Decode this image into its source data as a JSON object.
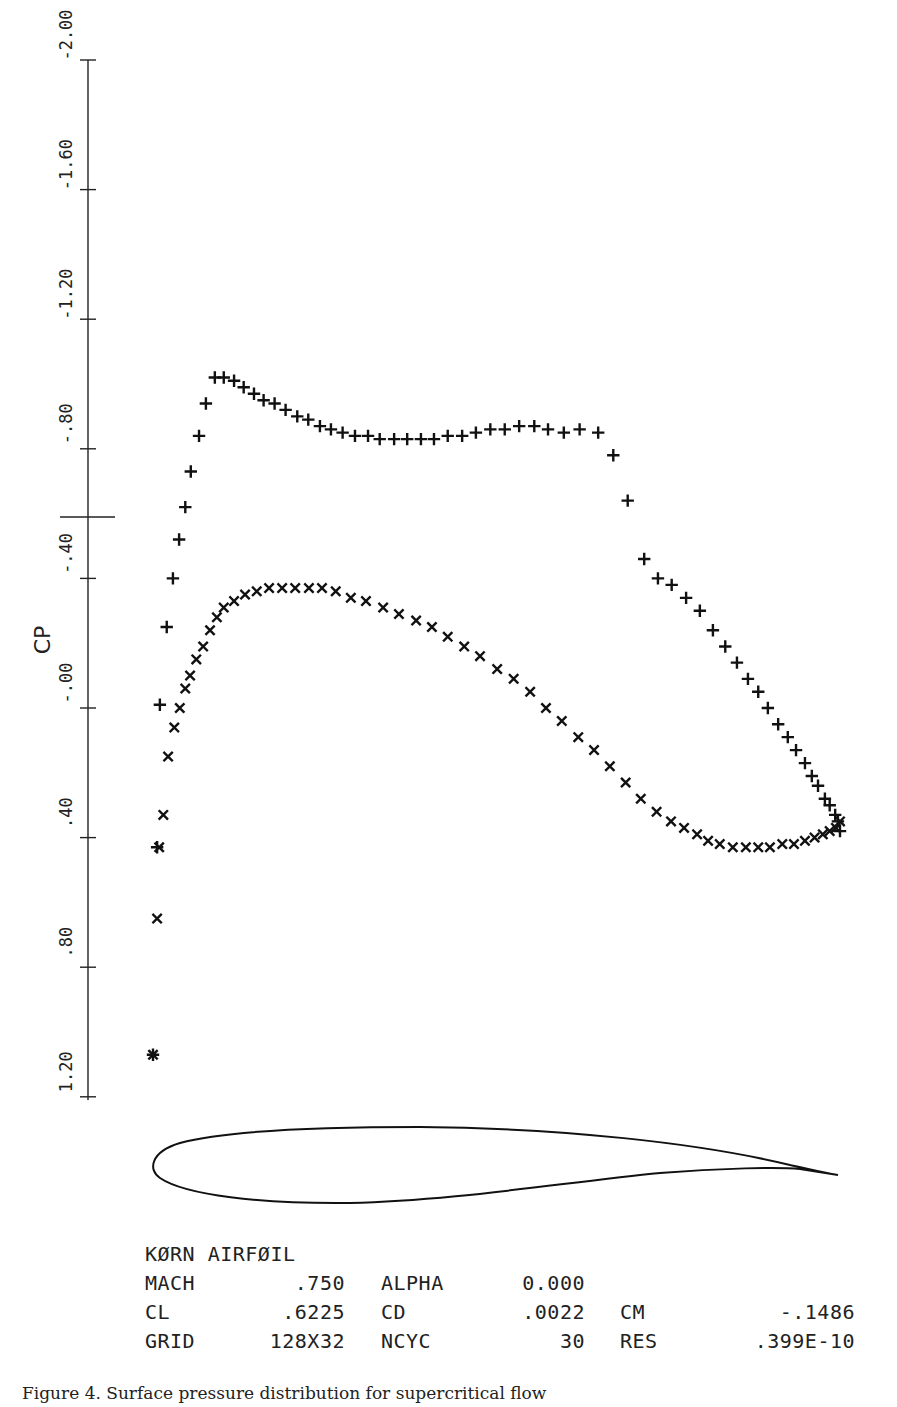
{
  "chart_data": {
    "type": "scatter",
    "xlabel": "",
    "ylabel": "CP",
    "ylim": [
      1.2,
      -2.0
    ],
    "y_inverted": true,
    "yticks": [
      -2.0,
      -1.6,
      -1.2,
      -0.8,
      -0.4,
      0.0,
      0.4,
      0.8,
      1.2
    ],
    "ytick_labels": [
      "-2.00",
      "-1.60",
      "-1.20",
      "-.80",
      "-.40",
      "-.00",
      ".40",
      ".80",
      "1.20"
    ],
    "critical_cp_marker": -0.59,
    "grid": false,
    "legend": null,
    "x_description": "chordwise position x/c (0 = leading edge, 1 = trailing edge); drawn aligned with airfoil below",
    "series": [
      {
        "name": "upper surface",
        "marker": "+",
        "x": [
          0.0,
          0.006,
          0.01,
          0.02,
          0.029,
          0.038,
          0.047,
          0.055,
          0.067,
          0.077,
          0.09,
          0.103,
          0.118,
          0.132,
          0.147,
          0.161,
          0.177,
          0.193,
          0.21,
          0.226,
          0.243,
          0.259,
          0.276,
          0.294,
          0.313,
          0.33,
          0.351,
          0.37,
          0.39,
          0.409,
          0.429,
          0.45,
          0.47,
          0.491,
          0.512,
          0.533,
          0.555,
          0.575,
          0.598,
          0.621,
          0.648,
          0.67,
          0.691,
          0.715,
          0.735,
          0.755,
          0.776,
          0.796,
          0.815,
          0.833,
          0.85,
          0.866,
          0.881,
          0.895,
          0.91,
          0.924,
          0.936,
          0.949,
          0.959,
          0.968,
          0.978,
          0.985,
          0.993,
          0.997,
          1.0
        ],
        "values": [
          1.07,
          0.43,
          -0.01,
          -0.25,
          -0.4,
          -0.52,
          -0.62,
          -0.73,
          -0.84,
          -0.94,
          -1.02,
          -1.02,
          -1.01,
          -0.99,
          -0.97,
          -0.95,
          -0.94,
          -0.92,
          -0.9,
          -0.89,
          -0.87,
          -0.86,
          -0.85,
          -0.84,
          -0.84,
          -0.83,
          -0.83,
          -0.83,
          -0.83,
          -0.83,
          -0.84,
          -0.84,
          -0.85,
          -0.86,
          -0.86,
          -0.87,
          -0.87,
          -0.86,
          -0.85,
          -0.86,
          -0.85,
          -0.78,
          -0.64,
          -0.46,
          -0.4,
          -0.38,
          -0.34,
          -0.3,
          -0.24,
          -0.19,
          -0.14,
          -0.09,
          -0.05,
          0.0,
          0.05,
          0.09,
          0.13,
          0.17,
          0.21,
          0.24,
          0.28,
          0.3,
          0.33,
          0.35,
          0.38
        ]
      },
      {
        "name": "lower surface",
        "marker": "x",
        "x": [
          0.0,
          0.006,
          0.009,
          0.015,
          0.022,
          0.031,
          0.039,
          0.047,
          0.054,
          0.063,
          0.073,
          0.083,
          0.093,
          0.103,
          0.118,
          0.134,
          0.151,
          0.169,
          0.188,
          0.207,
          0.227,
          0.246,
          0.266,
          0.288,
          0.31,
          0.335,
          0.358,
          0.383,
          0.406,
          0.429,
          0.453,
          0.476,
          0.501,
          0.525,
          0.549,
          0.572,
          0.595,
          0.619,
          0.642,
          0.665,
          0.688,
          0.71,
          0.733,
          0.754,
          0.773,
          0.792,
          0.808,
          0.825,
          0.844,
          0.863,
          0.881,
          0.898,
          0.916,
          0.933,
          0.949,
          0.963,
          0.975,
          0.985,
          0.994,
          1.0
        ],
        "values": [
          1.07,
          0.65,
          0.43,
          0.33,
          0.15,
          0.06,
          0.0,
          -0.06,
          -0.1,
          -0.15,
          -0.19,
          -0.24,
          -0.28,
          -0.31,
          -0.33,
          -0.35,
          -0.36,
          -0.37,
          -0.37,
          -0.37,
          -0.37,
          -0.37,
          -0.36,
          -0.34,
          -0.33,
          -0.31,
          -0.29,
          -0.27,
          -0.25,
          -0.22,
          -0.19,
          -0.16,
          -0.12,
          -0.09,
          -0.05,
          0.0,
          0.04,
          0.09,
          0.13,
          0.18,
          0.23,
          0.28,
          0.32,
          0.35,
          0.37,
          0.39,
          0.41,
          0.42,
          0.43,
          0.43,
          0.43,
          0.43,
          0.42,
          0.42,
          0.41,
          0.4,
          0.39,
          0.38,
          0.37,
          0.35
        ]
      }
    ]
  },
  "axis": {
    "ylabel": "CP",
    "tick_labels": [
      "-2.00",
      "-1.60",
      "-1.20",
      "-.80",
      "-.40",
      "-.00",
      ".40",
      ".80",
      "1.20"
    ]
  },
  "info": {
    "title": "KØRN AIRFØIL",
    "rows": [
      {
        "k1": "MACH",
        "v1": ".750",
        "k2": "ALPHA",
        "v2": "0.000",
        "k3": "",
        "v3": ""
      },
      {
        "k1": "CL",
        "v1": ".6225",
        "k2": "CD",
        "v2": ".0022",
        "k3": "CM",
        "v3": "-.1486"
      },
      {
        "k1": "GRID",
        "v1": "128X32",
        "k2": "NCYC",
        "v2": "30",
        "k3": "RES",
        "v3": ".399E-10"
      }
    ]
  },
  "caption": "Figure 4.  Surface pressure distribution for supercritical flow"
}
